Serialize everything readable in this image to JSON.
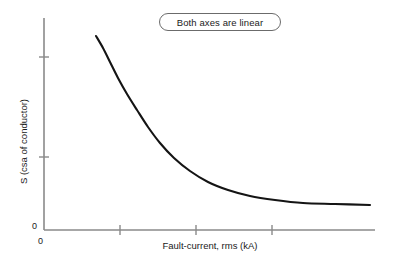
{
  "figure": {
    "note_label": "Both axes are linear",
    "origin_y_label": "0",
    "origin_x_label": "0"
  },
  "chart_data": {
    "type": "line",
    "title": "Both axes are linear",
    "xlabel": "Fault-current, rms (kA)",
    "ylabel": "S (csa of conductor)",
    "grid": false,
    "legend": null,
    "annotations": [
      "Both axes are linear"
    ],
    "axes": {
      "x": {
        "label": "Fault-current, rms (kA)",
        "scale": "linear",
        "origin_label": "0",
        "tick_labels": [],
        "tick_positions_px": [
          120,
          196,
          272
        ],
        "range_px": [
          44,
          375
        ]
      },
      "y": {
        "label": "S (csa of conductor)",
        "scale": "linear",
        "origin_label": "0",
        "tick_labels": [],
        "tick_positions_px": [
          57,
          157
        ],
        "range_px": [
          18,
          230
        ]
      }
    },
    "series": [
      {
        "name": "S vs fault-current",
        "shape": "inverse-decay",
        "points_px": [
          [
            96,
            36
          ],
          [
            103,
            48
          ],
          [
            110,
            62
          ],
          [
            118,
            78
          ],
          [
            127,
            94
          ],
          [
            137,
            110
          ],
          [
            148,
            127
          ],
          [
            160,
            143
          ],
          [
            174,
            158
          ],
          [
            190,
            171
          ],
          [
            208,
            182
          ],
          [
            228,
            190
          ],
          [
            250,
            196
          ],
          [
            275,
            200
          ],
          [
            303,
            203
          ],
          [
            335,
            204
          ],
          [
            370,
            205
          ]
        ],
        "points_data": [
          {
            "x": 1.0,
            "y": 10.0
          },
          {
            "x": 1.2,
            "y": 8.6
          },
          {
            "x": 1.4,
            "y": 7.4
          },
          {
            "x": 1.7,
            "y": 6.3
          },
          {
            "x": 2.0,
            "y": 5.4
          },
          {
            "x": 2.4,
            "y": 4.6
          },
          {
            "x": 2.8,
            "y": 3.9
          },
          {
            "x": 3.3,
            "y": 3.3
          },
          {
            "x": 3.9,
            "y": 2.8
          },
          {
            "x": 4.6,
            "y": 2.4
          },
          {
            "x": 5.4,
            "y": 2.1
          },
          {
            "x": 6.4,
            "y": 1.9
          },
          {
            "x": 7.5,
            "y": 1.7
          },
          {
            "x": 8.8,
            "y": 1.6
          },
          {
            "x": 10.3,
            "y": 1.5
          },
          {
            "x": 11.9,
            "y": 1.45
          },
          {
            "x": 13.6,
            "y": 1.42
          }
        ]
      }
    ],
    "colors": {
      "curve": "#141414",
      "axis": "#8a8a8a",
      "text": "#1a1a1a",
      "note_border": "#6b6b6b",
      "background": "#ffffff"
    }
  }
}
